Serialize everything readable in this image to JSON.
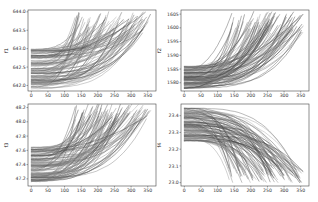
{
  "chart_data": [
    {
      "type": "line",
      "panel": "top-left",
      "title": "",
      "xlabel": "",
      "ylabel": "f1",
      "xlim": [
        -10,
        375
      ],
      "ylim": [
        641.85,
        644.05
      ],
      "xticks": [
        0,
        50,
        100,
        150,
        200,
        250,
        300,
        350
      ],
      "yticks": [
        642.0,
        642.5,
        643.0,
        643.5,
        644.0
      ],
      "ytick_labels": [
        "642.0",
        "642.5",
        "643.0",
        "643.5",
        "644.0"
      ],
      "grid": false,
      "legend": null,
      "trend": "increasing, convex",
      "n_series_approx": 100,
      "start_range": [
        641.9,
        643.0
      ],
      "end_range": [
        643.4,
        644.0
      ],
      "end_x_range": [
        130,
        360
      ],
      "series_color": "#555555"
    },
    {
      "type": "line",
      "panel": "top-right",
      "title": "",
      "xlabel": "",
      "ylabel": "f2",
      "xlim": [
        -10,
        375
      ],
      "ylim": [
        1577,
        1606.5
      ],
      "xticks": [
        0,
        50,
        100,
        150,
        200,
        250,
        300,
        350
      ],
      "yticks": [
        1580,
        1585,
        1590,
        1595,
        1600,
        1605
      ],
      "ytick_labels": [
        "1580",
        "1585",
        "1590",
        "1595",
        "1600",
        "1605"
      ],
      "grid": false,
      "legend": null,
      "trend": "increasing, convex",
      "n_series_approx": 100,
      "start_range": [
        1578,
        1586
      ],
      "end_range": [
        1598,
        1606
      ],
      "end_x_range": [
        130,
        360
      ],
      "series_color": "#555555"
    },
    {
      "type": "line",
      "panel": "bottom-left",
      "title": "",
      "xlabel": "",
      "ylabel": "f3",
      "xlim": [
        -10,
        375
      ],
      "ylim": [
        47.1,
        48.25
      ],
      "xticks": [
        0,
        50,
        100,
        150,
        200,
        250,
        300,
        350
      ],
      "yticks": [
        47.2,
        47.4,
        47.6,
        47.8,
        48.0,
        48.2
      ],
      "ytick_labels": [
        "47.2",
        "47.4",
        "47.6",
        "47.8",
        "48.0",
        "48.2"
      ],
      "grid": false,
      "legend": null,
      "trend": "increasing, convex",
      "n_series_approx": 100,
      "start_range": [
        47.15,
        47.65
      ],
      "end_range": [
        48.0,
        48.25
      ],
      "end_x_range": [
        130,
        360
      ],
      "series_color": "#555555"
    },
    {
      "type": "line",
      "panel": "bottom-right",
      "title": "",
      "xlabel": "",
      "ylabel": "f4",
      "xlim": [
        -10,
        375
      ],
      "ylim": [
        22.98,
        23.47
      ],
      "xticks": [
        0,
        50,
        100,
        150,
        200,
        250,
        300,
        350
      ],
      "yticks": [
        23.0,
        23.1,
        23.2,
        23.3,
        23.4
      ],
      "ytick_labels": [
        "23.0",
        "23.1",
        "23.2",
        "23.3",
        "23.4"
      ],
      "grid": false,
      "legend": null,
      "trend": "decreasing, concave",
      "n_series_approx": 100,
      "start_range": [
        23.25,
        23.45
      ],
      "end_range": [
        23.0,
        23.1
      ],
      "end_x_range": [
        130,
        360
      ],
      "series_color": "#555555"
    }
  ],
  "panels": [
    {
      "id": "p1",
      "ylabel": "f1",
      "direction": "up"
    },
    {
      "id": "p2",
      "ylabel": "f2",
      "direction": "up"
    },
    {
      "id": "p3",
      "ylabel": "f3",
      "direction": "up"
    },
    {
      "id": "p4",
      "ylabel": "f4",
      "direction": "down"
    }
  ],
  "xtick_labels": [
    "0",
    "50",
    "100",
    "150",
    "200",
    "250",
    "300",
    "350"
  ]
}
